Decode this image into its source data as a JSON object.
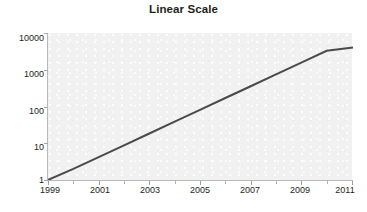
{
  "chart_data": {
    "type": "line",
    "title": "Linear Scale",
    "xlabel": "",
    "ylabel": "",
    "yscale": "log",
    "xscale": "linear",
    "grid": false,
    "legend": false,
    "xlim": [
      1999,
      2011
    ],
    "ylim": [
      1,
      10000
    ],
    "x_tick_labels": [
      "1999",
      "2001",
      "2003",
      "2005",
      "2007",
      "2009",
      "2011"
    ],
    "x_tick_values": [
      1999,
      2001,
      2003,
      2005,
      2007,
      2009,
      2011
    ],
    "x_minor_ticks": [
      2000,
      2002,
      2004,
      2006,
      2008,
      2010
    ],
    "y_tick_labels": [
      "10000",
      "1000",
      "100",
      "10",
      "1"
    ],
    "y_tick_values": [
      10000,
      1000,
      100,
      10,
      1
    ],
    "series": [
      {
        "name": "Exponential growth",
        "x": [
          1999,
          2000,
          2001,
          2002,
          2003,
          2004,
          2005,
          2006,
          2007,
          2008,
          2009,
          2010,
          2011
        ],
        "values": [
          1,
          2,
          4.2,
          8.8,
          18.4,
          38.6,
          81,
          170,
          356,
          746,
          1565,
          3281,
          4000
        ],
        "color": "#4a4a4a",
        "line_width": 2
      }
    ],
    "annotations": []
  },
  "style": {
    "plot_background": "#f1f1f1",
    "page_background": "#ffffff",
    "axis_color": "#b9b9b9",
    "tick_color": "#a8a8a8",
    "text_color": "#231f20",
    "line_color": "#4a4a4a"
  }
}
